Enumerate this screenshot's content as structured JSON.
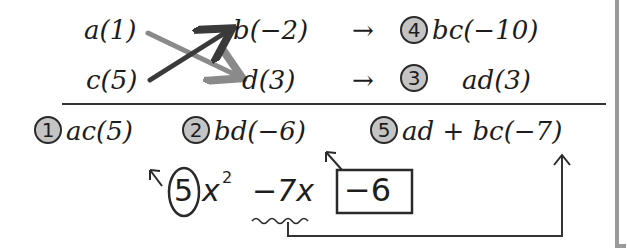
{
  "top_row": {
    "left": "a(1)",
    "right": "b(−2)",
    "arrow": "→",
    "badge": "4",
    "result": "bc(−10)"
  },
  "bottom_row": {
    "left": "c(5)",
    "right": "d(3)",
    "arrow": "→",
    "badge": "3",
    "result": "ad(3)"
  },
  "results_row": [
    {
      "badge": "1",
      "expr": "ac(5)"
    },
    {
      "badge": "2",
      "expr": "bd(−6)"
    },
    {
      "badge": "5",
      "expr": "ad + bc(−7)"
    }
  ],
  "handwritten": {
    "coef_circled": "5",
    "x2": "x",
    "exp": "2",
    "middle": "−7x",
    "constant_boxed": "−6"
  },
  "colors": {
    "arrow_dark": "#3a3a3a",
    "arrow_light": "#8a8a8a",
    "badge_fill": "#c4c4c4",
    "frame": "#9a9a9a"
  }
}
